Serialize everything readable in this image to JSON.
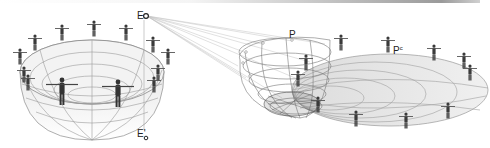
{
  "diagram": {
    "labels": {
      "eye_point": "E",
      "eye_point_prime": "E'",
      "point_p": "P",
      "point_p_prime_base": "P",
      "point_p_prime_sup": "c"
    },
    "colors": {
      "background": "#ffffff",
      "bowl_fill": "#ececec",
      "grid_line": "#8a8a8a",
      "figure": "#3a3a3a",
      "projection_line": "#bdbdbd"
    },
    "left_bowl": {
      "figure_count": 14
    },
    "right_surface": {
      "figure_count": 12
    }
  }
}
